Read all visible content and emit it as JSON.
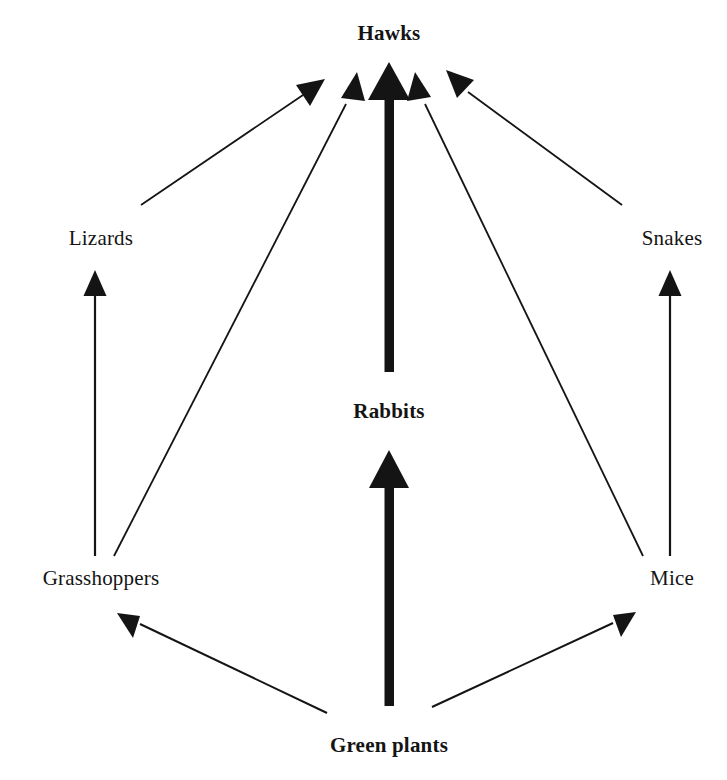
{
  "diagram": {
    "background_color": "#ffffff",
    "ink_color": "#141414",
    "nodes": [
      {
        "id": "hawks",
        "label": "Hawks",
        "emphasis": "bold",
        "trophic_level": 4,
        "x": 389,
        "y": 33
      },
      {
        "id": "lizards",
        "label": "Lizards",
        "emphasis": "plain",
        "trophic_level": 3,
        "x": 101,
        "y": 238
      },
      {
        "id": "snakes",
        "label": "Snakes",
        "emphasis": "plain",
        "trophic_level": 3,
        "x": 672,
        "y": 238
      },
      {
        "id": "rabbits",
        "label": "Rabbits",
        "emphasis": "bold",
        "trophic_level": 2,
        "x": 389,
        "y": 411
      },
      {
        "id": "grasshoppers",
        "label": "Grasshoppers",
        "emphasis": "plain",
        "trophic_level": 2,
        "x": 101,
        "y": 578
      },
      {
        "id": "mice",
        "label": "Mice",
        "emphasis": "plain",
        "trophic_level": 2,
        "x": 672,
        "y": 578
      },
      {
        "id": "greenplants",
        "label": "Green plants",
        "emphasis": "bold",
        "trophic_level": 1,
        "x": 389,
        "y": 745
      }
    ],
    "edges": [
      {
        "id": "grasshoppers-to-lizards",
        "from": "grasshoppers",
        "to": "lizards",
        "weight": "thin",
        "x1": 95,
        "y1": 556,
        "x2": 95,
        "y2": 276
      },
      {
        "id": "mice-to-snakes",
        "from": "mice",
        "to": "snakes",
        "weight": "thin",
        "x1": 670,
        "y1": 556,
        "x2": 670,
        "y2": 276
      },
      {
        "id": "lizards-to-hawks",
        "from": "lizards",
        "to": "hawks",
        "weight": "thin",
        "x1": 141,
        "y1": 205,
        "x2": 319,
        "y2": 84
      },
      {
        "id": "grasshoppers-to-hawks",
        "from": "grasshoppers",
        "to": "hawks",
        "weight": "thin",
        "x1": 114,
        "y1": 556,
        "x2": 354,
        "y2": 86
      },
      {
        "id": "rabbits-to-hawks",
        "from": "rabbits",
        "to": "hawks",
        "weight": "thick",
        "x1": 389,
        "y1": 372,
        "x2": 389,
        "y2": 62
      },
      {
        "id": "mice-to-hawks",
        "from": "mice",
        "to": "hawks",
        "weight": "thin",
        "x1": 643,
        "y1": 556,
        "x2": 420,
        "y2": 86
      },
      {
        "id": "snakes-to-hawks",
        "from": "snakes",
        "to": "hawks",
        "weight": "thin",
        "x1": 622,
        "y1": 205,
        "x2": 451,
        "y2": 80
      },
      {
        "id": "greenplants-to-rabbits",
        "from": "greenplants",
        "to": "rabbits",
        "weight": "thick",
        "x1": 389,
        "y1": 706,
        "x2": 389,
        "y2": 450
      },
      {
        "id": "greenplants-to-grasshoppers",
        "from": "greenplants",
        "to": "grasshoppers",
        "weight": "thin",
        "x1": 327,
        "y1": 713,
        "x2": 126,
        "y2": 617
      },
      {
        "id": "greenplants-to-mice",
        "from": "greenplants",
        "to": "mice",
        "weight": "thin",
        "x1": 432,
        "y1": 707,
        "x2": 628,
        "y2": 616
      }
    ]
  }
}
